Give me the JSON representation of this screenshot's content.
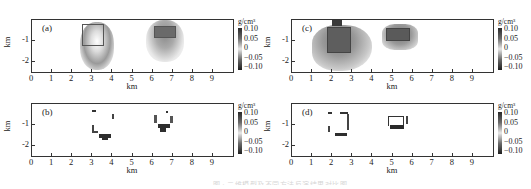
{
  "figure": {
    "caption": "图 · 二维模型及不同方法反演结果对比图"
  },
  "colors": {
    "axis": "#333333",
    "anomaly_dark": "#3a3a3a",
    "anomaly_mid": "#6e6e6e",
    "background": "#ffffff"
  },
  "panels": [
    {
      "id": "a",
      "label": "(a)",
      "xlabel": "km",
      "ylabel": "km"
    },
    {
      "id": "b",
      "label": "(b)",
      "xlabel": "km",
      "ylabel": "km"
    },
    {
      "id": "c",
      "label": "(c)",
      "xlabel": "km",
      "ylabel": "km"
    },
    {
      "id": "d",
      "label": "(d)",
      "xlabel": "km",
      "ylabel": "km"
    }
  ],
  "axes": {
    "x_ticks": [
      "0",
      "1",
      "2",
      "3",
      "4",
      "5",
      "6",
      "7",
      "8",
      "9"
    ],
    "y_ticks": [
      "-1",
      "-2"
    ]
  },
  "colorbar": {
    "unit": "g/cm³",
    "ticks": [
      "0.10",
      "0.05",
      "0",
      "−0.05",
      "−0.10"
    ]
  },
  "chart_data": [
    {
      "type": "heatmap",
      "title": "(a)",
      "xlabel": "km",
      "ylabel": "km",
      "xlim": [
        0,
        10
      ],
      "ylim": [
        -2.5,
        -0.3
      ],
      "x_ticks": [
        0,
        1,
        2,
        3,
        4,
        5,
        6,
        7,
        8,
        9
      ],
      "y_ticks": [
        -1,
        -2
      ],
      "colorbar": {
        "label": "g/cm³",
        "range": [
          -0.1,
          0.1
        ],
        "ticks": [
          0.1,
          0.05,
          0,
          -0.05,
          -0.1
        ]
      },
      "features": [
        {
          "shape": "rect-outline",
          "x": [
            3.0,
            4.0
          ],
          "y": [
            -0.5,
            -1.5
          ],
          "note": "model body 1 with smooth anomaly halo"
        },
        {
          "shape": "rect-outline",
          "x": [
            6.0,
            7.0
          ],
          "y": [
            -0.6,
            -1.1
          ],
          "note": "model body 2 with smooth anomaly halo"
        }
      ]
    },
    {
      "type": "heatmap",
      "title": "(b)",
      "xlabel": "km",
      "ylabel": "km",
      "xlim": [
        0,
        10
      ],
      "ylim": [
        -2.5,
        -0.3
      ],
      "colorbar": {
        "label": "g/cm³",
        "range": [
          -0.1,
          0.1
        ]
      },
      "features": [
        {
          "shape": "sparse-blocks",
          "x": [
            3.0,
            4.0
          ],
          "y": [
            -0.5,
            -1.7
          ],
          "note": "focused result, body 1"
        },
        {
          "shape": "sparse-blocks",
          "x": [
            6.0,
            7.0
          ],
          "y": [
            -0.6,
            -1.5
          ],
          "note": "focused result, body 2"
        }
      ]
    },
    {
      "type": "heatmap",
      "title": "(c)",
      "xlabel": "km",
      "ylabel": "km",
      "xlim": [
        0,
        10
      ],
      "ylim": [
        -2.5,
        -0.3
      ],
      "colorbar": {
        "label": "g/cm³",
        "range": [
          -0.1,
          0.1
        ]
      },
      "features": [
        {
          "shape": "rect-outline",
          "x": [
            1.7,
            2.8
          ],
          "y": [
            -0.6,
            -1.5
          ],
          "note": "model body 1 with smeared anomaly"
        },
        {
          "shape": "rect-outline",
          "x": [
            4.7,
            5.8
          ],
          "y": [
            -0.7,
            -1.1
          ],
          "note": "model body 2 with smeared anomaly"
        }
      ]
    },
    {
      "type": "heatmap",
      "title": "(d)",
      "xlabel": "km",
      "ylabel": "km",
      "xlim": [
        0,
        10
      ],
      "ylim": [
        -2.5,
        -0.3
      ],
      "colorbar": {
        "label": "g/cm³",
        "range": [
          -0.1,
          0.1
        ]
      },
      "features": [
        {
          "shape": "sparse-blocks",
          "x": [
            1.7,
            2.8
          ],
          "y": [
            -0.5,
            -1.6
          ],
          "note": "focused result, body 1"
        },
        {
          "shape": "sparse-blocks",
          "x": [
            4.7,
            5.8
          ],
          "y": [
            -0.7,
            -1.3
          ],
          "note": "focused result, body 2"
        }
      ]
    }
  ]
}
